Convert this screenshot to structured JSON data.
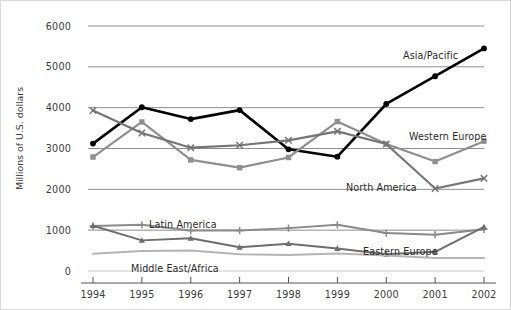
{
  "chart_data": {
    "type": "line",
    "title": "",
    "xlabel": "",
    "ylabel": "Millions of U.S. dollars",
    "categories": [
      "1994",
      "1995",
      "1996",
      "1997",
      "1998",
      "1999",
      "2000",
      "2001",
      "2002"
    ],
    "x": [
      1994,
      1995,
      1996,
      1997,
      1998,
      1999,
      2000,
      2001,
      2002
    ],
    "ylim": [
      0,
      6000
    ],
    "xlim": [
      1994,
      2002
    ],
    "yticks": [
      0,
      1000,
      2000,
      3000,
      4000,
      5000,
      6000
    ],
    "ytick_labels": [
      "0",
      "1000",
      "2000",
      "3000",
      "4000",
      "5000",
      "6000"
    ],
    "grid": "horizontal",
    "legend_position": "inline-annotations",
    "series": [
      {
        "name": "Asia/Pacific",
        "color": "#000000",
        "marker": "circle",
        "width": 2.6,
        "values": [
          3120,
          4010,
          3720,
          3940,
          2980,
          2800,
          4090,
          4770,
          5450
        ],
        "label_x": 402,
        "label_y": 49
      },
      {
        "name": "Western Europe",
        "color": "#8f8f8f",
        "marker": "square",
        "width": 2.2,
        "values": [
          2790,
          3650,
          2720,
          2530,
          2780,
          3660,
          3110,
          2680,
          3180
        ],
        "label_x": 408,
        "label_y": 130
      },
      {
        "name": "North America",
        "color": "#757575",
        "marker": "x",
        "width": 2.2,
        "values": [
          3930,
          3380,
          3020,
          3080,
          3200,
          3420,
          3110,
          2020,
          2270
        ],
        "label_x": 345,
        "label_y": 181
      },
      {
        "name": "Latin America",
        "color": "#8a8a8a",
        "marker": "plus",
        "width": 2.0,
        "values": [
          1100,
          1130,
          990,
          990,
          1050,
          1130,
          930,
          890,
          1020
        ],
        "label_x": 148,
        "label_y": 218
      },
      {
        "name": "Eastern Europe",
        "color": "#6e6e6e",
        "marker": "triangle",
        "width": 2.0,
        "values": [
          1110,
          750,
          800,
          580,
          670,
          550,
          410,
          470,
          1080
        ],
        "label_x": 362,
        "label_y": 245
      },
      {
        "name": "Middle East/Africa",
        "color": "#b5b5b5",
        "marker": "none",
        "width": 2.0,
        "values": [
          420,
          490,
          500,
          410,
          390,
          430,
          380,
          320,
          320
        ],
        "label_x": 130,
        "label_y": 262
      }
    ]
  },
  "axes": {
    "y_title": "Millions of U.S. dollars",
    "ytick_labels": [
      "6000",
      "5000",
      "4000",
      "3000",
      "2000",
      "1000",
      "0"
    ],
    "xtick_labels": [
      "1994",
      "1995",
      "1996",
      "1997",
      "1998",
      "1999",
      "2000",
      "2001",
      "2002"
    ]
  }
}
